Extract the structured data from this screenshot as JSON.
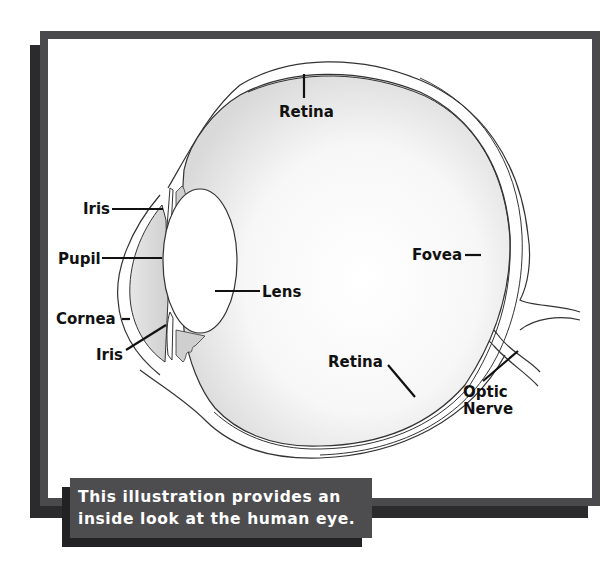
{
  "figure": {
    "labels": {
      "retina_top": "Retina",
      "iris_top": "Iris",
      "pupil": "Pupil",
      "lens": "Lens",
      "fovea": "Fovea",
      "cornea": "Cornea",
      "iris_bottom": "Iris",
      "retina_bottom": "Retina",
      "optic_nerve_line1": "Optic",
      "optic_nerve_line2": "Nerve"
    }
  },
  "caption": {
    "line1": "This illustration provides an",
    "line2": "inside look at the human eye."
  },
  "colors": {
    "frame": "#4a4a4c",
    "frame_shadow": "#2b2b2d",
    "caption_bg": "#4d4d4f",
    "caption_text": "#ffffff",
    "label_text": "#111111"
  }
}
